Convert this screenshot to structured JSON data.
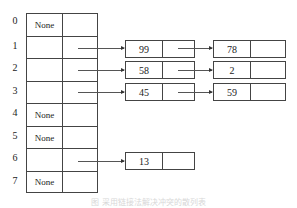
{
  "diagram": {
    "type": "hash-table-separate-chaining",
    "buckets": [
      {
        "index": "0",
        "value": "None"
      },
      {
        "index": "1",
        "value": ""
      },
      {
        "index": "2",
        "value": ""
      },
      {
        "index": "3",
        "value": ""
      },
      {
        "index": "4",
        "value": "None"
      },
      {
        "index": "5",
        "value": "None"
      },
      {
        "index": "6",
        "value": ""
      },
      {
        "index": "7",
        "value": "None"
      }
    ],
    "chains": {
      "bucket_1": [
        "99",
        "78"
      ],
      "bucket_2": [
        "58",
        "2"
      ],
      "bucket_3": [
        "45",
        "59"
      ],
      "bucket_6": [
        "13"
      ]
    },
    "caption": "图 采用链接法解决冲突的散列表"
  }
}
